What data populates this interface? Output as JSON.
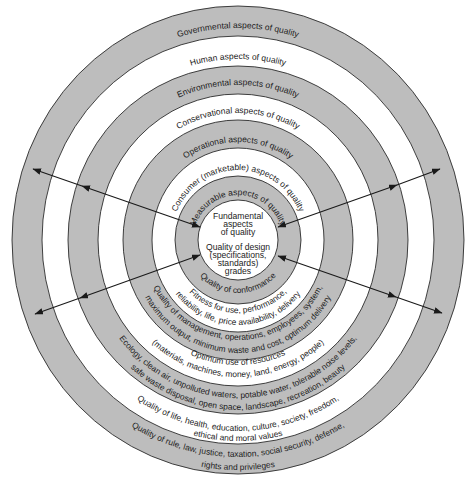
{
  "colors": {
    "ring_gray": "#bdbdbd",
    "ring_white": "#ffffff",
    "stroke": "#2b2b2b",
    "text": "#1c1c1c"
  },
  "rings": [
    {
      "name": "governmental",
      "top_label": "Governmental aspects of quality",
      "bottom_lines": [
        "Quality of rule, law, justice, taxation, social security, defense,",
        "rights and privileges"
      ]
    },
    {
      "name": "human",
      "top_label": "Human aspects of quality",
      "bottom_lines": [
        "Quality of life, health, education, culture, society, freedom,",
        "ethical and moral values"
      ]
    },
    {
      "name": "environmental",
      "top_label": "Environmental aspects of quality",
      "bottom_lines": [
        "Ecology, clean air, unpolluted waters, potable water, tolerable noise levels,",
        "safe waste disposal, open space, landscape, recreation, beauty"
      ]
    },
    {
      "name": "conservational",
      "top_label": "Conservational aspects of quality",
      "bottom_lines": [
        "Optimum use of resources",
        "(materials, machines, money, land, energy, people)"
      ]
    },
    {
      "name": "operational",
      "top_label": "Operational aspects of quality",
      "bottom_lines": [
        "Quality of management, operations, employees, system,",
        "maximum output, minimum waste and cost, optimum delivery"
      ]
    },
    {
      "name": "consumer",
      "top_label": "Consumer (marketable) aspects of quality",
      "bottom_lines": [
        "Fitness for use, performance,",
        "reliability, life, price availability, delivery"
      ]
    },
    {
      "name": "measurable",
      "top_label": "Measurable aspects of quality",
      "bottom_lines": [
        "Quality of conformance"
      ]
    }
  ],
  "center": {
    "lines": [
      "Fundamental",
      "aspects",
      "of quality",
      "Quality of design",
      "(specifications,",
      "standards)",
      "grades"
    ]
  }
}
